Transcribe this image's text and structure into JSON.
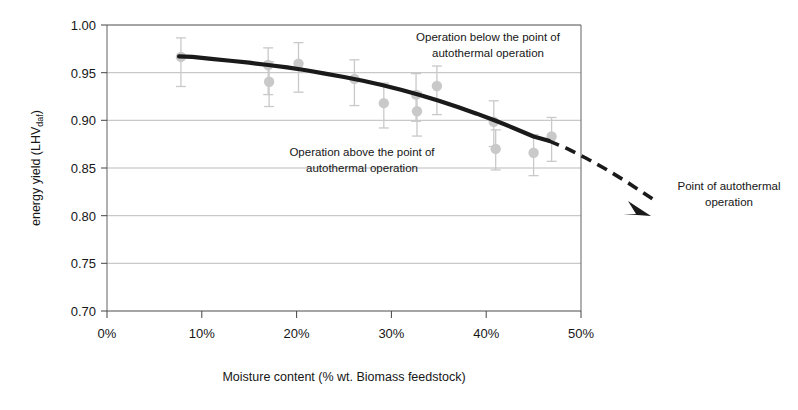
{
  "chart_data": {
    "type": "line",
    "title": "",
    "xlabel": "Moisture content (%  wt. Biomass feedstock)",
    "ylabel": "energy yield (LHV",
    "ylabel_sub": "daf",
    "ylabel_suffix": ")",
    "xlim": [
      0,
      50
    ],
    "ylim": [
      0.7,
      1.0
    ],
    "xticks": [
      "0%",
      "10%",
      "20%",
      "30%",
      "40%",
      "50%"
    ],
    "xtick_values": [
      0,
      10,
      20,
      30,
      40,
      50
    ],
    "yticks": [
      "1.00",
      "0.95",
      "0.90",
      "0.85",
      "0.80",
      "0.75",
      "0.70"
    ],
    "ytick_values": [
      1.0,
      0.95,
      0.9,
      0.85,
      0.8,
      0.75,
      0.7
    ],
    "grid": "horizontal",
    "legend": "none",
    "series": [
      {
        "name": "model curve (solid)",
        "style": "solid",
        "color": "#1a1a1a",
        "x": [
          7.6,
          9,
          11,
          13,
          15,
          17,
          19,
          21,
          23,
          25,
          27,
          29,
          31,
          33,
          35,
          37,
          39,
          41,
          43,
          45,
          46.6
        ],
        "y": [
          0.967,
          0.9665,
          0.9645,
          0.9625,
          0.9605,
          0.958,
          0.9555,
          0.9525,
          0.949,
          0.9455,
          0.9415,
          0.937,
          0.932,
          0.9265,
          0.9205,
          0.914,
          0.907,
          0.8995,
          0.8915,
          0.883,
          0.8785
        ]
      },
      {
        "name": "extrapolation (dashed, arrow to autothermal point)",
        "style": "dashed",
        "color": "#1a1a1a",
        "x": [
          46.6,
          48.5,
          50.5,
          52.5,
          54.5,
          56.5,
          58
        ],
        "y": [
          0.8785,
          0.8705,
          0.8605,
          0.8495,
          0.8375,
          0.8245,
          0.8145
        ]
      }
    ],
    "scatter": {
      "name": "experimental data",
      "marker": "circle",
      "color": "#c9c9c9",
      "errorbar_color": "#c9c9c9",
      "points": [
        {
          "x": 7.8,
          "y": 0.9665,
          "yerr_low": 0.031,
          "yerr_high": 0.02
        },
        {
          "x": 17.0,
          "y": 0.958,
          "yerr_low": 0.031,
          "yerr_high": 0.018
        },
        {
          "x": 17.1,
          "y": 0.9405,
          "yerr_low": 0.026,
          "yerr_high": 0.021
        },
        {
          "x": 20.2,
          "y": 0.9595,
          "yerr_low": 0.03,
          "yerr_high": 0.022
        },
        {
          "x": 26.1,
          "y": 0.9435,
          "yerr_low": 0.028,
          "yerr_high": 0.02
        },
        {
          "x": 29.2,
          "y": 0.918,
          "yerr_low": 0.026,
          "yerr_high": 0.021
        },
        {
          "x": 32.6,
          "y": 0.927,
          "yerr_low": 0.028,
          "yerr_high": 0.022
        },
        {
          "x": 32.7,
          "y": 0.9095,
          "yerr_low": 0.026,
          "yerr_high": 0.02
        },
        {
          "x": 34.8,
          "y": 0.936,
          "yerr_low": 0.03,
          "yerr_high": 0.021
        },
        {
          "x": 40.8,
          "y": 0.8985,
          "yerr_low": 0.026,
          "yerr_high": 0.022
        },
        {
          "x": 41.0,
          "y": 0.87,
          "yerr_low": 0.022,
          "yerr_high": 0.02
        },
        {
          "x": 45.0,
          "y": 0.866,
          "yerr_low": 0.024,
          "yerr_high": 0.019
        },
        {
          "x": 46.9,
          "y": 0.883,
          "yerr_low": 0.026,
          "yerr_high": 0.02
        }
      ]
    },
    "annotations": [
      {
        "id": "below-point",
        "lines": [
          "Operation below the point of",
          "autothermal operation"
        ],
        "x_px": 488,
        "y_px": 41
      },
      {
        "id": "above-point",
        "lines": [
          "Operation above the point of",
          "autothermal operation"
        ],
        "x_px": 362,
        "y_px": 156
      },
      {
        "id": "autothermal-point",
        "lines": [
          "Point of autothermal",
          "operation"
        ],
        "x_px": 729,
        "y_px": 190
      }
    ]
  }
}
